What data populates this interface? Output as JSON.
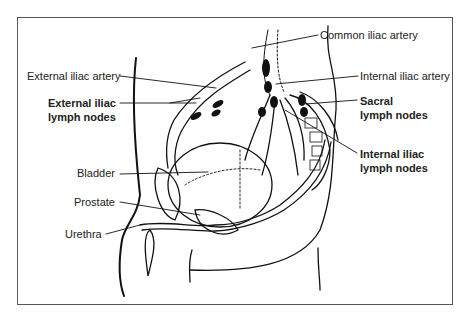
{
  "diagram": {
    "type": "anatomical sagittal section, male pelvis, lymphatic drainage",
    "labels": {
      "common_iliac_artery": "Common iliac artery",
      "external_iliac_artery": "External iliac artery",
      "internal_iliac_artery": "Internal iliac artery",
      "external_iliac_nodes_l1": "External iliac",
      "external_iliac_nodes_l2": "lymph nodes",
      "sacral_nodes_l1": "Sacral",
      "sacral_nodes_l2": "lymph nodes",
      "internal_iliac_nodes_l1": "Internal iliac",
      "internal_iliac_nodes_l2": "lymph nodes",
      "bladder": "Bladder",
      "prostate": "Prostate",
      "urethra": "Urethra"
    },
    "colors": {
      "line": "#111111",
      "frame": "#555555",
      "node_fill": "#111111"
    }
  }
}
